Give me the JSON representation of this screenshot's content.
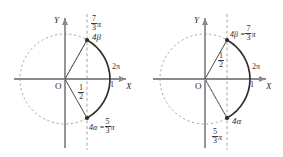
{
  "figure": {
    "colors": {
      "axis": "#8a8a8a",
      "curve": "#3a3a3a",
      "dashed": "#9b9b9b",
      "text": "#2b2b2b",
      "background": "#ffffff"
    }
  },
  "panels": [
    {
      "id": "left",
      "axis_y_label": "Y",
      "axis_x_label": "X",
      "origin_label": "O",
      "labels": {
        "angle_top": {
          "text": "7/3 π",
          "num": "7",
          "den": "3",
          "pi": "π"
        },
        "point_top": {
          "text": "4β"
        },
        "tick_one": "1",
        "two_pi": "2π",
        "half": {
          "num": "1",
          "den": "2"
        },
        "point_bottom": {
          "prefix": "4α =",
          "num": "5",
          "den": "3",
          "pi": "π"
        }
      },
      "geometry": {
        "origin": [
          65,
          79
        ],
        "radius": 45,
        "vertical_dashed_x": 87,
        "point_top": [
          87,
          40
        ],
        "point_bottom": [
          87,
          118
        ],
        "arc_angle_top_deg": 60,
        "arc_angle_bottom_deg": -60
      }
    },
    {
      "id": "right",
      "axis_y_label": "Y",
      "axis_x_label": "X",
      "origin_label": "O",
      "labels": {
        "point_top": {
          "prefix": "4β =",
          "num": "7",
          "den": "3",
          "pi": "π"
        },
        "tick_one": "1",
        "two_pi": "2π",
        "half": {
          "num": "1",
          "den": "2"
        },
        "point_bottom": {
          "text": "4α"
        },
        "angle_bottom": {
          "num": "5",
          "den": "3",
          "pi": "π"
        }
      },
      "geometry": {
        "origin": [
          64,
          79
        ],
        "radius": 45,
        "vertical_dashed_x": 86,
        "point_top": [
          86,
          40
        ],
        "point_bottom": [
          86,
          118
        ],
        "arc_angle_top_deg": 60,
        "arc_angle_bottom_deg": -60
      }
    }
  ]
}
